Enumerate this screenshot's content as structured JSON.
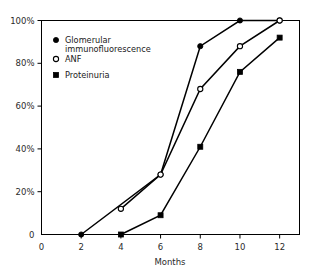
{
  "chart_data": {
    "type": "line",
    "title": "",
    "subtitle": "",
    "xlabel": "Months",
    "ylabel": "",
    "x": [
      0,
      2,
      4,
      6,
      8,
      10,
      12
    ],
    "xlim": [
      0,
      13
    ],
    "ylim": [
      0,
      100
    ],
    "xticks": [
      "0",
      "2",
      "4",
      "6",
      "8",
      "10",
      "12"
    ],
    "yticks": [
      "0",
      "20%",
      "40%",
      "60%",
      "80%",
      "100%"
    ],
    "ytick_values": [
      0,
      20,
      40,
      60,
      80,
      100
    ],
    "grid": false,
    "legend_position": "upper left inside",
    "series": [
      {
        "name": "Glomerular immunofluorescence",
        "marker": "filled-circle",
        "x": [
          2,
          6,
          8,
          10,
          12
        ],
        "values": [
          0,
          28,
          88,
          100,
          100
        ]
      },
      {
        "name": "ANF",
        "marker": "open-circle",
        "x": [
          4,
          6,
          8,
          10,
          12
        ],
        "values": [
          12,
          28,
          68,
          88,
          100
        ]
      },
      {
        "name": "Proteinuria",
        "marker": "filled-square",
        "x": [
          4,
          6,
          8,
          10,
          12
        ],
        "values": [
          0,
          9,
          41,
          76,
          92
        ]
      }
    ]
  },
  "legend": {
    "entries": [
      {
        "label_line1": "Glomerular",
        "label_line2": "immunofluorescence",
        "marker": "filled-circle"
      },
      {
        "label_line1": "ANF",
        "label_line2": "",
        "marker": "open-circle"
      },
      {
        "label_line1": "Proteinuria",
        "label_line2": "",
        "marker": "filled-square"
      }
    ]
  },
  "axes": {
    "x_title": "Months",
    "x_tick_labels": [
      "0",
      "2",
      "4",
      "6",
      "8",
      "10",
      "12"
    ],
    "y_tick_labels": [
      "0",
      "20%",
      "40%",
      "60%",
      "80%",
      "100%"
    ]
  },
  "colors": {
    "ink": "#000000",
    "background": "#ffffff",
    "text": "#1a1a1a"
  }
}
